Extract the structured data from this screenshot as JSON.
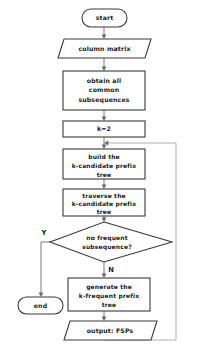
{
  "diagram": {
    "background_color": "#ffffff",
    "node_stroke_color": "#3a3a3a",
    "connector_color": "#7a7a7a",
    "nodes": {
      "start": {
        "label": "start",
        "shape": "terminator"
      },
      "input_column_matrix": {
        "label": "column matrix",
        "shape": "parallelogram"
      },
      "obtain_subsequences": {
        "line1": "obtain all",
        "line2": "common",
        "line3": "subsequences",
        "shape": "process"
      },
      "set_k": {
        "label": "k=2",
        "shape": "process"
      },
      "build_tree": {
        "line1": "build the",
        "line2": "k-candidate prefix",
        "line3": "tree",
        "shape": "process"
      },
      "traverse_tree": {
        "line1": "traverse the",
        "line2": "k-candidate prefix",
        "line3": "tree",
        "shape": "process"
      },
      "decision": {
        "line1": "no frequent",
        "line2": "subsequence?",
        "shape": "decision"
      },
      "generate_tree": {
        "line1": "generate the",
        "line2": "k-frequent prefix",
        "line3": "tree",
        "shape": "process"
      },
      "output_fsps": {
        "label": "output: FSPs",
        "shape": "parallelogram"
      },
      "end": {
        "label": "end",
        "shape": "terminator"
      }
    },
    "branch_labels": {
      "yes": "Y",
      "no": "N"
    }
  }
}
